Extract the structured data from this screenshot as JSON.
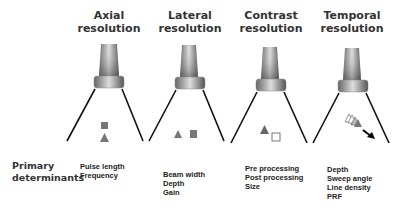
{
  "columns": [
    {
      "title_line1": "Axial",
      "title_line2": "resolution",
      "determinants": [
        "Pulse length",
        "Frequency"
      ]
    },
    {
      "title_line1": "Lateral",
      "title_line2": "resolution",
      "determinants": [
        "Beam width",
        "Depth",
        "Gain"
      ]
    },
    {
      "title_line1": "Contrast",
      "title_line2": "resolution",
      "determinants": [
        "Pre processing",
        "Post processing",
        "Size"
      ]
    },
    {
      "title_line1": "Temporal",
      "title_line2": "resolution",
      "determinants": [
        "Depth",
        "Sweep angle",
        "Line density",
        "PRF"
      ]
    }
  ],
  "row_label": {
    "line1": "Primary",
    "line2": "determinants"
  },
  "colors": {
    "text": "#333333",
    "shape_fill": "#777777",
    "line": "#111111"
  }
}
